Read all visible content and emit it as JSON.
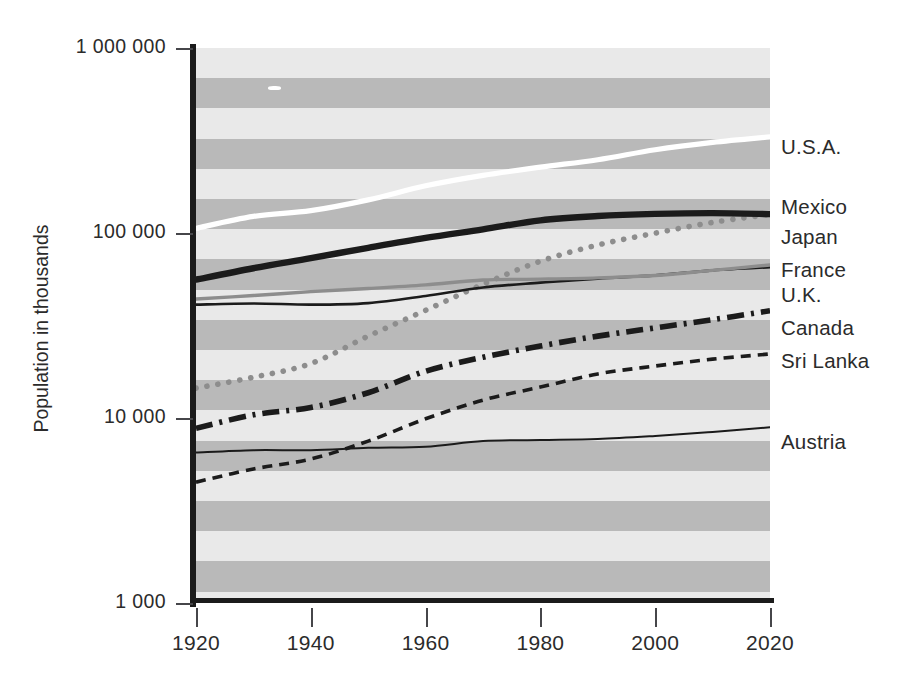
{
  "chart_data": {
    "type": "line",
    "title": "",
    "xlabel": "",
    "ylabel": "Population in thousands",
    "y_scale": "log",
    "ylim": [
      1000,
      1000000
    ],
    "xlim": [
      1920,
      2020
    ],
    "grid": "horizontal alternating gray bands",
    "legend_position": "right, at end of each line",
    "y_tick_labels": [
      "1 000 000",
      "100 000",
      "10 000",
      "1 000"
    ],
    "y_tick_values": [
      1000000,
      100000,
      10000,
      1000
    ],
    "x_tick_labels": [
      "1920",
      "1940",
      "1960",
      "1980",
      "2000",
      "2020"
    ],
    "x_tick_values": [
      1920,
      1940,
      1960,
      1980,
      2000,
      2020
    ],
    "x": [
      1920,
      1930,
      1940,
      1950,
      1960,
      1970,
      1980,
      1990,
      2000,
      2010,
      2020
    ],
    "series": [
      {
        "name": "U.S.A.",
        "style": "solid-white-thick",
        "color": "#ffffff",
        "values": [
          106000,
          123000,
          132000,
          151000,
          180000,
          205000,
          227000,
          249000,
          282000,
          309000,
          331000
        ]
      },
      {
        "name": "Mexico",
        "style": "dotted-gray",
        "color": "#8d8d8d",
        "values": [
          14500,
          16600,
          19700,
          27700,
          38200,
          52800,
          70400,
          86100,
          99800,
          114100,
          126000
        ]
      },
      {
        "name": "Japan",
        "style": "solid-black-thick",
        "color": "#1b1b1b",
        "values": [
          56000,
          64500,
          73100,
          83200,
          94100,
          104700,
          117100,
          123500,
          126800,
          128100,
          126500
        ]
      },
      {
        "name": "France",
        "style": "solid-black-thin",
        "color": "#1b1b1b",
        "values": [
          41000,
          41600,
          41000,
          41800,
          45700,
          50800,
          53900,
          56700,
          59000,
          62800,
          65300
        ]
      },
      {
        "name": "U.K.",
        "style": "solid-gray-medium",
        "color": "#8d8d8d",
        "values": [
          44000,
          45900,
          48200,
          50100,
          52400,
          55700,
          56300,
          57200,
          58900,
          62800,
          67200
        ]
      },
      {
        "name": "Canada",
        "style": "dash-dot-black-thick",
        "color": "#1b1b1b",
        "values": [
          8800,
          10400,
          11400,
          13700,
          17900,
          21300,
          24500,
          27700,
          30700,
          34000,
          38000
        ]
      },
      {
        "name": "Sri Lanka",
        "style": "dashed-black-fine",
        "color": "#1b1b1b",
        "values": [
          4500,
          5300,
          6000,
          7500,
          9900,
          12500,
          14700,
          17300,
          19100,
          20800,
          22200
        ]
      },
      {
        "name": "Austria",
        "style": "solid-black-hairline",
        "color": "#1b1b1b",
        "values": [
          6500,
          6700,
          6700,
          6900,
          7000,
          7500,
          7600,
          7700,
          8000,
          8400,
          8900
        ]
      }
    ],
    "colors": {
      "band_light": "#e9e9e9",
      "band_dark": "#b9b9b9",
      "axis": "#1b1b1b",
      "text": "#2b2b2b",
      "background": "#ffffff"
    }
  }
}
